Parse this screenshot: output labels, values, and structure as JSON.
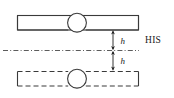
{
  "figure": {
    "type": "engineering-diagram",
    "width": 174,
    "height": 98,
    "background_color": "#ffffff",
    "stroke_color": "#3a3a3a",
    "text_color": "#1a1a1a",
    "labels": {
      "reference_line": "HIS",
      "dimension_upper": "h",
      "dimension_lower": "h"
    },
    "elements": {
      "upper_bar": {
        "name": "solid-bar",
        "style": "solid",
        "x": 17,
        "y": 15,
        "width": 122,
        "height": 15
      },
      "upper_joint": {
        "name": "circular-joint",
        "cx": 77,
        "cy": 22.5,
        "r": 9.5,
        "style": "solid"
      },
      "lower_bar": {
        "name": "dashed-bar",
        "style": "dashed",
        "x": 17,
        "y": 71,
        "width": 122,
        "height": 15
      },
      "lower_joint": {
        "name": "circular-joint",
        "cx": 77,
        "cy": 78.5,
        "r": 9.5,
        "style": "solid"
      },
      "reference_line": {
        "name": "his-datum-line",
        "style": "dash-dot",
        "x1": 3,
        "x2": 138,
        "y": 50
      },
      "dimension_upper": {
        "x": 113,
        "y_top": 30,
        "y_bottom": 50
      },
      "dimension_lower": {
        "x": 113,
        "y_top": 50,
        "y_bottom": 71
      }
    }
  }
}
